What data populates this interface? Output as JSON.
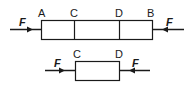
{
  "diagram": {
    "top_bar": {
      "labels": {
        "A": "A",
        "C": "C",
        "D": "D",
        "B": "B"
      },
      "force_left": "F",
      "force_right": "F",
      "stroke_color": "#1a1a1a"
    },
    "bottom_segment": {
      "labels": {
        "C": "C",
        "D": "D"
      },
      "force_left": "F",
      "force_right": "F"
    }
  }
}
